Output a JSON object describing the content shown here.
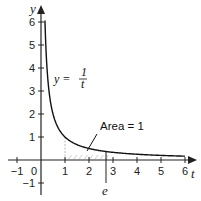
{
  "chart_data": {
    "type": "line",
    "title": "",
    "xlabel": "t",
    "ylabel": "y",
    "xlim": [
      -1.4,
      6.5
    ],
    "ylim": [
      -1.5,
      6.7
    ],
    "grid": false,
    "x_ticks": [
      -1,
      1,
      2,
      3,
      4,
      5,
      6
    ],
    "y_ticks": [
      -1,
      1,
      2,
      3,
      4,
      5,
      6
    ],
    "origin_label": "0",
    "series": [
      {
        "name": "y = 1/t",
        "function": "1/t",
        "domain": [
          0.165,
          6
        ],
        "x": [
          0.165,
          0.2,
          0.25,
          0.3,
          0.4,
          0.5,
          0.75,
          1,
          1.5,
          2,
          2.5,
          2.718,
          3,
          4,
          5,
          6
        ],
        "values": [
          6.06,
          5.0,
          4.0,
          3.33,
          2.5,
          2.0,
          1.33,
          1.0,
          0.667,
          0.5,
          0.4,
          0.368,
          0.333,
          0.25,
          0.2,
          0.167
        ]
      }
    ],
    "shaded_region": {
      "from": 1,
      "to": 2.718,
      "label": "Area = 1"
    },
    "annotations": [
      {
        "text": "y = 1/t",
        "numerator": "1",
        "denominator": "t",
        "position": [
          2.0,
          3.5
        ]
      },
      {
        "text": "Area = 1",
        "position": [
          2.8,
          1.2
        ]
      },
      {
        "text": "e",
        "x": 2.718,
        "note": "marker line below axis"
      }
    ]
  },
  "labels": {
    "x_axis": "t",
    "y_axis": "y",
    "equation_lhs": "y =",
    "equation_num": "1",
    "equation_den": "t",
    "area": "Area = 1",
    "e_marker": "e",
    "origin": "0",
    "x_ticks": [
      "−1",
      "1",
      "2",
      "3",
      "4",
      "5",
      "6"
    ],
    "y_ticks": [
      "−1",
      "1",
      "2",
      "3",
      "4",
      "5",
      "6"
    ]
  },
  "colors": {
    "axis": "#222222",
    "curve": "#111111",
    "shade_stroke": "#aaaaaa"
  }
}
